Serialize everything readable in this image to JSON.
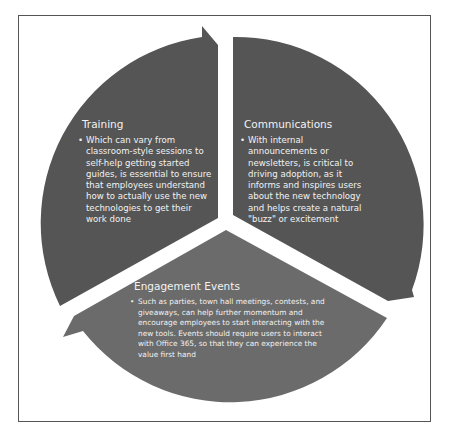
{
  "diagram": {
    "type": "cycle",
    "colors": {
      "frame_border": "#555555",
      "top_segments": "#555555",
      "bottom_segment": "#6b6b6b",
      "text": "#f2f2f2",
      "background": "#ffffff"
    },
    "segments": [
      {
        "id": "training",
        "title": "Training",
        "bullet": "•",
        "body": "Which can vary from classroom-style sessions to self-help getting started guides, is essential to ensure that employees understand how to actually use the new technologies to get their work done"
      },
      {
        "id": "communications",
        "title": "Communications",
        "bullet": "•",
        "body": "With internal announcements or newsletters, is critical to driving adoption, as it informs and inspires users about the new technology and helps create a natural \"buzz\" or excitement"
      },
      {
        "id": "engagement-events",
        "title": "Engagement Events",
        "bullet": "•",
        "body": "Such as parties, town hall meetings, contests, and giveaways, can help further momentum and encourage employees to start interacting with the new tools. Events should require users to interact with Office 365, so that they can experience the value first hand"
      }
    ]
  }
}
